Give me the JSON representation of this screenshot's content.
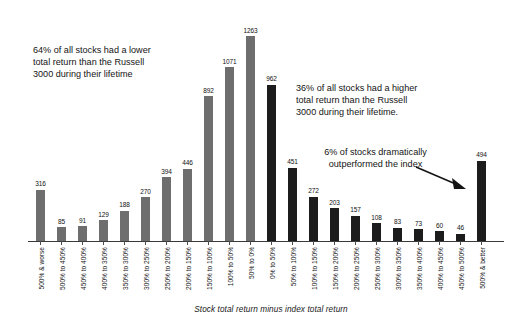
{
  "chart_data": {
    "type": "bar",
    "title": "",
    "subtitle": "",
    "xlabel": "Stock total return minus index total return",
    "ylabel": "",
    "ylim": [
      0,
      1340
    ],
    "grid": false,
    "legend": null,
    "categories": [
      "500% & worse",
      "500% to 450%",
      "450% to 400%",
      "400% to 350%",
      "350% to 300%",
      "300% to 250%",
      "250% to 200%",
      "200% to 150%",
      "150% to 100%",
      "100% to 50%",
      "50% to 0%",
      "0% to 50%",
      "50% to 100%",
      "100% to 150%",
      "150% to 200%",
      "200% to 250%",
      "250% to 300%",
      "300% to 350%",
      "350% to 400%",
      "400% to 450%",
      "450% to 500%",
      "500% & better"
    ],
    "values": [
      316,
      85,
      91,
      129,
      188,
      270,
      394,
      446,
      892,
      1071,
      1263,
      962,
      451,
      272,
      203,
      157,
      108,
      83,
      73,
      60,
      46,
      494
    ],
    "bar_colors": [
      "#6e6e6e",
      "#6e6e6e",
      "#6e6e6e",
      "#6e6e6e",
      "#6e6e6e",
      "#6e6e6e",
      "#6e6e6e",
      "#6e6e6e",
      "#6e6e6e",
      "#6e6e6e",
      "#6e6e6e",
      "#1c1c1c",
      "#1c1c1c",
      "#1c1c1c",
      "#1c1c1c",
      "#1c1c1c",
      "#1c1c1c",
      "#1c1c1c",
      "#1c1c1c",
      "#1c1c1c",
      "#1c1c1c",
      "#1c1c1c"
    ],
    "annotations": [
      "64% of all stocks had a lower total return than the Russell 3000 during their lifetime",
      "36% of all stocks had a higher total return than the Russell 3000 during their lifetime.",
      "6% of stocks dramatically outperformed the index"
    ]
  },
  "annotations": {
    "left": "64% of all stocks had a lower\ntotal return than the Russell\n3000 during their lifetime",
    "right": "36% of all stocks had a higher\ntotal return than the Russell\n3000 during their lifetime.",
    "arrow_text": "6% of stocks dramatically\noutperformed the index"
  },
  "axis": {
    "x_title": "Stock total return minus index total return"
  },
  "colors": {
    "negative_bar": "#6e6e6e",
    "positive_bar": "#1c1c1c",
    "axis": "#3a3a3a",
    "text": "#141414",
    "background": "#ffffff"
  }
}
